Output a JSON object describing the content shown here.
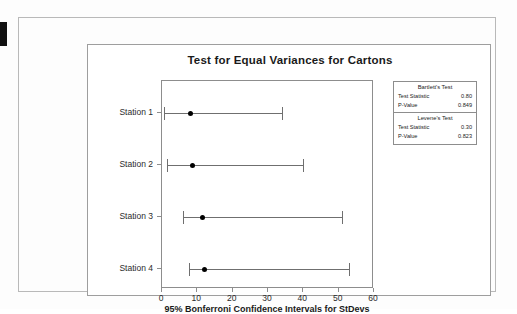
{
  "page": {
    "edge_mark": "black-edge-tab"
  },
  "chart_data": {
    "type": "interval",
    "title": "Test for Equal Variances for Cartons",
    "xlabel": "95% Bonferroni Confidence Intervals for StDevs",
    "ylabel": "",
    "xlim": [
      0,
      60
    ],
    "xticks": [
      0,
      10,
      20,
      30,
      40,
      50,
      60
    ],
    "xtick_labels": [
      "0",
      "10",
      "20",
      "30",
      "40",
      "50",
      "60"
    ],
    "categories": [
      "Station 1",
      "Station 2",
      "Station 3",
      "Station 4"
    ],
    "grid": false,
    "legend": "none",
    "series": [
      {
        "name": "95% Bonferroni CI for StDev",
        "points": [
          {
            "category": "Station 1",
            "estimate": 8.0,
            "lower": 0.5,
            "upper": 34.0
          },
          {
            "category": "Station 2",
            "estimate": 8.5,
            "lower": 1.5,
            "upper": 40.0
          },
          {
            "category": "Station 3",
            "estimate": 11.5,
            "lower": 6.0,
            "upper": 51.0
          },
          {
            "category": "Station 4",
            "estimate": 12.0,
            "lower": 7.5,
            "upper": 53.0
          }
        ]
      }
    ],
    "annotations": []
  },
  "stats": {
    "blocks": [
      {
        "title": "Bartlett's Test",
        "rows": [
          {
            "label": "Test Statistic",
            "value": "0.80"
          },
          {
            "label": "P-Value",
            "value": "0.849"
          }
        ]
      },
      {
        "title": "Levene's Test",
        "rows": [
          {
            "label": "Test Statistic",
            "value": "0.30"
          },
          {
            "label": "P-Value",
            "value": "0.823"
          }
        ]
      }
    ]
  },
  "colors": {
    "line": "#6f6f6f",
    "dot": "#000000",
    "frame": "#8d8d8d",
    "text": "#1a1a1a",
    "background": "#ffffff"
  }
}
